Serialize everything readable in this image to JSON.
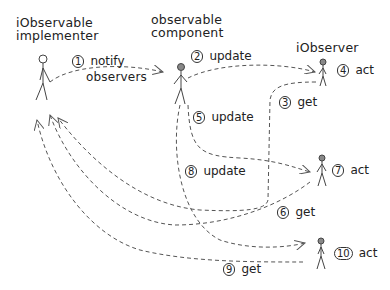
{
  "diagram": {
    "type": "sequence-sketch",
    "stroke_color": "#555555",
    "text_color": "#222222",
    "background": "#ffffff",
    "actors": [
      {
        "id": "implementer",
        "label_line1": "iObservable",
        "label_line2": "implementer"
      },
      {
        "id": "component",
        "label_line1": "observable",
        "label_line2": "component"
      },
      {
        "id": "observer",
        "label": "iObserver"
      }
    ],
    "steps": [
      {
        "num": "1",
        "text_line1": "notify",
        "text_line2": "observers"
      },
      {
        "num": "2",
        "text": "update"
      },
      {
        "num": "3",
        "text": "get"
      },
      {
        "num": "4",
        "text": "act"
      },
      {
        "num": "5",
        "text": "update"
      },
      {
        "num": "6",
        "text": "get"
      },
      {
        "num": "7",
        "text": "act"
      },
      {
        "num": "8",
        "text": "update"
      },
      {
        "num": "9",
        "text": "get"
      },
      {
        "num": "10",
        "text": "act"
      }
    ],
    "icons": {
      "figure": "stick-figure-icon",
      "arrow": "dashed-arrow"
    }
  }
}
